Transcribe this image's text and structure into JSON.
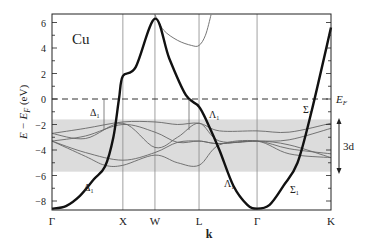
{
  "chart_data": {
    "type": "line",
    "title": "Cu",
    "subtitle": "Electronic band structure of copper",
    "xlabel": "k",
    "ylabel": "E − E_F (eV)",
    "ylim": [
      -9,
      7
    ],
    "yticks": [
      -8,
      -6,
      -4,
      -2,
      0,
      2,
      4,
      6
    ],
    "x_ticks": [
      {
        "label": "Γ",
        "pos": 0.0
      },
      {
        "label": "X",
        "pos": 0.254
      },
      {
        "label": "W",
        "pos": 0.369
      },
      {
        "label": "L",
        "pos": 0.527
      },
      {
        "label": "Γ",
        "pos": 0.735
      },
      {
        "label": "K",
        "pos": 1.0
      }
    ],
    "fermi_level": 0,
    "d_band_region": {
      "label": "3d",
      "ymin": -5.7,
      "ymax": -1.6
    },
    "annotations": [
      "Δ1",
      "Δ1",
      "Λ1",
      "Λ1",
      "Σ1",
      "Σ1",
      "E_F",
      "3d"
    ],
    "series": [
      {
        "name": "sp band (bold)",
        "style": "bold",
        "points": [
          [
            0.0,
            -8.6
          ],
          [
            0.05,
            -8.4
          ],
          [
            0.1,
            -7.6
          ],
          [
            0.15,
            -6.3
          ],
          [
            0.19,
            -5.3
          ],
          [
            0.22,
            -3.0
          ],
          [
            0.24,
            0.0
          ],
          [
            0.254,
            1.8
          ],
          [
            0.3,
            2.5
          ],
          [
            0.369,
            6.3
          ],
          [
            0.42,
            3.2
          ],
          [
            0.48,
            0.3
          ],
          [
            0.527,
            -0.6
          ],
          [
            0.56,
            -2.0
          ],
          [
            0.6,
            -4.0
          ],
          [
            0.65,
            -6.8
          ],
          [
            0.7,
            -8.3
          ],
          [
            0.735,
            -8.6
          ],
          [
            0.78,
            -8.3
          ],
          [
            0.83,
            -6.8
          ],
          [
            0.88,
            -5.0
          ],
          [
            0.93,
            -1.0
          ],
          [
            1.0,
            5.6
          ]
        ]
      },
      {
        "name": "upper sp band",
        "style": "thin",
        "points": [
          [
            0.369,
            6.6
          ],
          [
            0.4,
            5.4
          ],
          [
            0.45,
            4.6
          ],
          [
            0.5,
            4.2
          ],
          [
            0.527,
            4.2
          ],
          [
            0.55,
            5.0
          ],
          [
            0.57,
            6.6
          ]
        ]
      },
      {
        "name": "d band 1",
        "style": "thin",
        "points": [
          [
            0.0,
            -2.7
          ],
          [
            0.12,
            -2.3
          ],
          [
            0.254,
            -1.8
          ],
          [
            0.369,
            -1.8
          ],
          [
            0.45,
            -2.0
          ],
          [
            0.527,
            -1.9
          ],
          [
            0.6,
            -2.5
          ],
          [
            0.735,
            -2.5
          ],
          [
            0.85,
            -2.6
          ],
          [
            1.0,
            -1.9
          ]
        ]
      },
      {
        "name": "d band 2",
        "style": "thin",
        "points": [
          [
            0.0,
            -2.7
          ],
          [
            0.12,
            -3.1
          ],
          [
            0.254,
            -1.9
          ],
          [
            0.369,
            -3.8
          ],
          [
            0.45,
            -3.0
          ],
          [
            0.527,
            -1.9
          ],
          [
            0.6,
            -3.3
          ],
          [
            0.735,
            -3.3
          ],
          [
            0.85,
            -3.2
          ],
          [
            1.0,
            -2.3
          ]
        ]
      },
      {
        "name": "d band 3",
        "style": "thin",
        "points": [
          [
            0.0,
            -3.3
          ],
          [
            0.12,
            -2.9
          ],
          [
            0.254,
            -2.0
          ],
          [
            0.369,
            -2.6
          ],
          [
            0.45,
            -3.4
          ],
          [
            0.527,
            -3.3
          ],
          [
            0.6,
            -3.5
          ],
          [
            0.735,
            -3.3
          ],
          [
            0.85,
            -3.6
          ],
          [
            1.0,
            -4.6
          ]
        ]
      },
      {
        "name": "d band 4",
        "style": "thin",
        "points": [
          [
            0.0,
            -3.3
          ],
          [
            0.12,
            -4.2
          ],
          [
            0.254,
            -4.8
          ],
          [
            0.369,
            -4.2
          ],
          [
            0.45,
            -3.4
          ],
          [
            0.527,
            -3.3
          ],
          [
            0.6,
            -3.5
          ],
          [
            0.735,
            -3.3
          ],
          [
            0.85,
            -3.9
          ],
          [
            1.0,
            -4.3
          ]
        ]
      },
      {
        "name": "d band 5",
        "style": "thin",
        "points": [
          [
            0.0,
            -3.3
          ],
          [
            0.12,
            -4.5
          ],
          [
            0.19,
            -5.2
          ],
          [
            0.254,
            -5.2
          ],
          [
            0.369,
            -4.4
          ],
          [
            0.45,
            -5.0
          ],
          [
            0.527,
            -5.2
          ],
          [
            0.6,
            -3.6
          ],
          [
            0.735,
            -3.3
          ],
          [
            0.85,
            -4.3
          ],
          [
            1.0,
            -4.6
          ]
        ]
      }
    ]
  },
  "labels": {
    "title": "Cu",
    "xlabel": "k",
    "ylabel_main": "E − E",
    "ylabel_sub": "F",
    "ylabel_unit": " (eV)",
    "ef_label": "E",
    "ef_sub": "F",
    "d_label": "3d",
    "delta": "Δ",
    "lambda": "Λ",
    "sigma": "Σ",
    "sub1": "1"
  },
  "colors": {
    "band_bold": "#111111",
    "band_thin": "#666666",
    "grid": "#888888",
    "d_region": "#dcdcdc",
    "axis": "#222222"
  }
}
